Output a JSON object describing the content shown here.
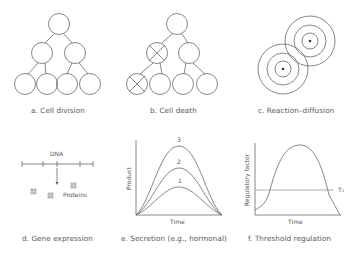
{
  "panels": {
    "a": {
      "caption": "a.  Cell division"
    },
    "b": {
      "caption": "b.  Cell death"
    },
    "c": {
      "caption": "c.  Reaction–diffusion"
    },
    "d": {
      "caption": "d.  Gene expression",
      "dna_label": "DNA",
      "proteins_label": "Proteins"
    },
    "e": {
      "caption": "e.  Secretion (e.g., hormonal)",
      "xlabel": "Time",
      "ylabel": "Product",
      "curve_labels": [
        "1",
        "2",
        "3"
      ]
    },
    "f": {
      "caption": "f.  Threshold regulation",
      "xlabel": "Time",
      "ylabel": "Regulatory factor",
      "threshold_label": "T₁"
    }
  },
  "colors": {
    "line": "#6a6a6a",
    "text": "#555555",
    "background": "#ffffff"
  }
}
